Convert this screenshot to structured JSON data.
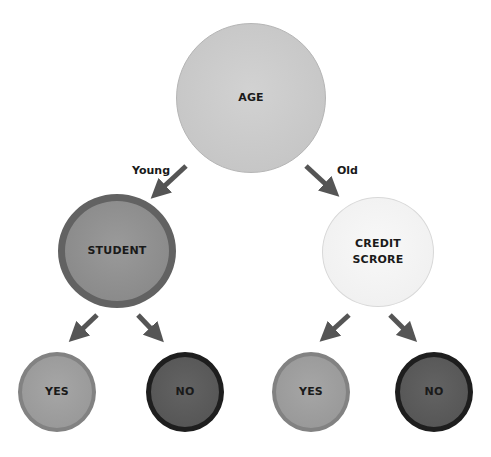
{
  "diagram": {
    "type": "decision-tree",
    "root": {
      "label": "AGE",
      "color": "#c8c8c8",
      "border": "#b5b5b5"
    },
    "edges": [
      {
        "label": "Young",
        "from": "AGE",
        "to": "STUDENT"
      },
      {
        "label": "Old",
        "from": "AGE",
        "to": "CREDIT SCRORE"
      },
      {
        "label": "",
        "from": "STUDENT",
        "to": "YES (left)"
      },
      {
        "label": "",
        "from": "STUDENT",
        "to": "NO (left)"
      },
      {
        "label": "",
        "from": "CREDIT SCRORE",
        "to": "YES (right)"
      },
      {
        "label": "",
        "from": "CREDIT SCRORE",
        "to": "NO (right)"
      }
    ],
    "student": {
      "label": "STUDENT",
      "color": "#8e8e8e",
      "border": "#5e5e5e"
    },
    "credit": {
      "line1": "CREDIT",
      "line2": "SCRORE",
      "color": "#f2f2f2",
      "border": "#d8d8d8"
    },
    "leaves": [
      {
        "label": "YES",
        "color": "#9c9c9c",
        "border": "#7e7e7e"
      },
      {
        "label": "NO",
        "color": "#5a5a5a",
        "border": "#1e1e1e"
      },
      {
        "label": "YES",
        "color": "#9c9c9c",
        "border": "#7e7e7e"
      },
      {
        "label": "NO",
        "color": "#5a5a5a",
        "border": "#1e1e1e"
      }
    ],
    "arrow_color": "#555555"
  }
}
